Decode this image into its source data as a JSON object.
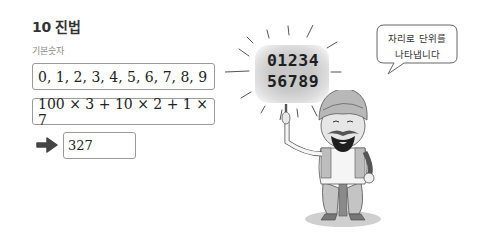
{
  "header": {
    "title": "10 진법",
    "subtitle": "기본숫자"
  },
  "boxes": {
    "digits_list": "0, 1, 2, 3, 4, 5, 6, 7, 8, 9",
    "expansion": "100 × 3 + 10 × 2 + 1 × 7",
    "result": "327"
  },
  "illustration": {
    "digits_line1": "01234",
    "digits_line2": "56789",
    "speech_line1": "자리로 단위를",
    "speech_line2": "나타냅니다",
    "arrow_icon": "right-arrow-icon"
  },
  "colors": {
    "border": "#9a9a9a",
    "text": "#222222",
    "subtitle": "#8a8a8a",
    "arrow": "#444444"
  }
}
